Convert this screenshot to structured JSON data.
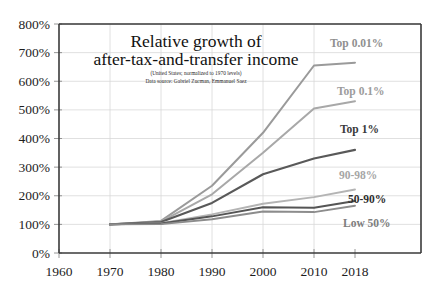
{
  "chart_data": {
    "type": "line",
    "title": "Relative growth of after-tax-and-transfer income",
    "title_line1": "Relative growth of",
    "title_line2": "after-tax-and-transfer income",
    "subtitle_line1": "(United States;  normalized to 1970 levels)",
    "subtitle_line2": "Data source: Gabriel Zucman, Emmanuel Saez",
    "xlabel": "",
    "ylabel": "",
    "x": [
      1960,
      1970,
      1980,
      1990,
      2000,
      2010,
      2018
    ],
    "xtick_labels": [
      "1960",
      "1970",
      "1980",
      "1990",
      "2000",
      "2010",
      "2018"
    ],
    "ytick_labels": [
      "0%",
      "100%",
      "200%",
      "300%",
      "400%",
      "500%",
      "600%",
      "700%",
      "800%"
    ],
    "ytick_values": [
      0,
      100,
      200,
      300,
      400,
      500,
      600,
      700,
      800
    ],
    "ylim": [
      0,
      800
    ],
    "xlim": [
      1960,
      2018
    ],
    "grid": true,
    "legend_position": "inline-right",
    "series": [
      {
        "name": "Top 0.01%",
        "color": "#9a9a9a",
        "label_color": "#8f8f8f",
        "width": 2.0,
        "x": [
          1970,
          1980,
          1990,
          2000,
          2010,
          2018
        ],
        "values": [
          100,
          112,
          235,
          420,
          655,
          665
        ]
      },
      {
        "name": "Top 0.1%",
        "color": "#a8a8a8",
        "label_color": "#9c9c9c",
        "width": 2.0,
        "x": [
          1970,
          1980,
          1990,
          2000,
          2010,
          2018
        ],
        "values": [
          100,
          110,
          205,
          350,
          505,
          530
        ]
      },
      {
        "name": "Top 1%",
        "color": "#595959",
        "label_color": "#3a3a3a",
        "width": 2.2,
        "x": [
          1970,
          1980,
          1990,
          2000,
          2010,
          2018
        ],
        "values": [
          100,
          108,
          175,
          275,
          330,
          360
        ]
      },
      {
        "name": "90-98%",
        "color": "#b4b4b4",
        "label_color": "#a6a6a6",
        "width": 1.9,
        "x": [
          1970,
          1980,
          1990,
          2000,
          2010,
          2018
        ],
        "values": [
          100,
          104,
          135,
          172,
          195,
          222
        ]
      },
      {
        "name": "50-90%",
        "color": "#555555",
        "label_color": "#2e2e2e",
        "width": 2.0,
        "x": [
          1970,
          1980,
          1990,
          2000,
          2010,
          2018
        ],
        "values": [
          100,
          103,
          128,
          160,
          158,
          182
        ]
      },
      {
        "name": "Low 50%",
        "color": "#8c8c8c",
        "label_color": "#7d7d7d",
        "width": 1.9,
        "x": [
          1970,
          1980,
          1990,
          2000,
          2010,
          2018
        ],
        "values": [
          100,
          101,
          118,
          145,
          143,
          165
        ]
      }
    ],
    "series_label_positions": [
      {
        "name": "Top 0.01%",
        "x": 330,
        "y": 47
      },
      {
        "name": "Top 0.1%",
        "x": 337,
        "y": 95
      },
      {
        "name": "Top 1%",
        "x": 340,
        "y": 133
      },
      {
        "name": "90-98%",
        "x": 339,
        "y": 179
      },
      {
        "name": "50-90%",
        "x": 348,
        "y": 203
      },
      {
        "name": "Low 50%",
        "x": 343,
        "y": 227
      }
    ]
  }
}
